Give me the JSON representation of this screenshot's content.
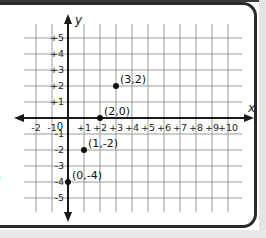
{
  "chart_data": {
    "type": "scatter",
    "title": "",
    "xlabel": "x",
    "ylabel": "y",
    "xlim": [
      -2,
      10
    ],
    "ylim": [
      -5,
      5
    ],
    "grid": true,
    "x_ticks": [
      "-2",
      "-1",
      "+1",
      "+2",
      "+3",
      "+4",
      "+5",
      "+6",
      "+7",
      "+8",
      "+9",
      "+10"
    ],
    "y_ticks": [
      "+5",
      "+4",
      "+3",
      "+2",
      "+1",
      "-1",
      "-2",
      "-3",
      "-4",
      "-5"
    ],
    "origin_label": "0",
    "points": [
      {
        "x": 3,
        "y": 2,
        "label": "(3,2)"
      },
      {
        "x": 2,
        "y": 0,
        "label": "(2,0)"
      },
      {
        "x": 1,
        "y": -2,
        "label": "(1,-2)"
      },
      {
        "x": 0,
        "y": -4,
        "label": "(0,-4)"
      }
    ]
  },
  "labels": {
    "x_axis": "x",
    "y_axis": "y",
    "origin": "0",
    "edge_glyph": ")"
  },
  "colors": {
    "grid": "#9a9a9a",
    "axis": "#1a1a1a",
    "point": "#111111",
    "frame": "#2b2b2b"
  }
}
